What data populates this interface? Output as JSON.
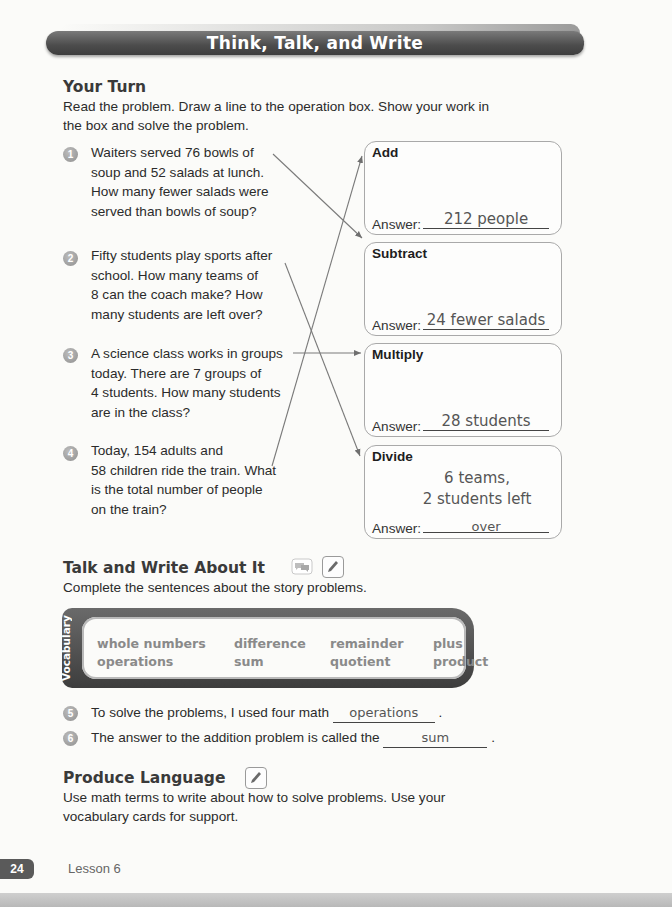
{
  "banner": {
    "title": "Think, Talk, and Write"
  },
  "your_turn": {
    "heading": "Your Turn",
    "instructions": [
      "Read the problem. Draw a line to the operation box. Show your work in",
      "the box and solve the problem."
    ]
  },
  "problems": [
    {
      "number": "1",
      "lines": [
        "Waiters served 76 bowls of",
        "soup and 52 salads at lunch.",
        "How many fewer salads were",
        "served than bowls of soup?"
      ],
      "connects_to": "Subtract"
    },
    {
      "number": "2",
      "lines": [
        "Fifty students play sports after",
        "school. How many teams of",
        "8 can the coach make? How",
        "many students are left over?"
      ],
      "connects_to": "Divide"
    },
    {
      "number": "3",
      "lines": [
        "A science class works in groups",
        "today. There are 7 groups of",
        "4 students. How many students",
        "are in the class?"
      ],
      "connects_to": "Multiply"
    },
    {
      "number": "4",
      "lines": [
        "Today, 154 adults and",
        "58 children ride the train. What",
        "is the total number of people",
        "on the train?"
      ],
      "connects_to": "Add"
    }
  ],
  "operation_boxes": [
    {
      "title": "Add",
      "answer_label": "Answer:",
      "answer": [
        "212 people"
      ]
    },
    {
      "title": "Subtract",
      "answer_label": "Answer:",
      "answer": [
        "24 fewer salads"
      ]
    },
    {
      "title": "Multiply",
      "answer_label": "Answer:",
      "answer": [
        "28 students"
      ]
    },
    {
      "title": "Divide",
      "answer_label": "Answer:",
      "answer": [
        "6 teams,",
        "2 students left",
        "over"
      ]
    }
  ],
  "talk_write": {
    "heading": "Talk and Write About It",
    "icons": [
      "talk-bubbles-icon",
      "pencil-icon"
    ],
    "instructions": "Complete the sentences about the story problems."
  },
  "vocabulary": {
    "label": "Vocabulary",
    "columns": [
      [
        "whole numbers",
        "operations"
      ],
      [
        "difference",
        "sum"
      ],
      [
        "remainder",
        "quotient"
      ],
      [
        "plus",
        "product"
      ]
    ]
  },
  "sentences": [
    {
      "number": "5",
      "before": "To solve the problems, I used four math",
      "answer": "operations",
      "after": "."
    },
    {
      "number": "6",
      "before": "The answer to the addition problem is called the",
      "answer": "sum",
      "after": "."
    }
  ],
  "produce_language": {
    "heading": "Produce Language",
    "icon": "pencil-icon",
    "lines": [
      "Use math terms to write about how to solve problems. Use your",
      "vocabulary cards for support."
    ]
  },
  "footer": {
    "page_number": "24",
    "lesson": "Lesson 6"
  }
}
